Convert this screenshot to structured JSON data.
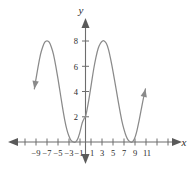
{
  "chart_data": {
    "type": "line",
    "title": "",
    "xlabel": "x",
    "ylabel": "y",
    "xlim": [
      -11.5,
      12.5
    ],
    "ylim": [
      -1.5,
      9.5
    ],
    "grid": false,
    "legend": null,
    "x_ticks": [
      -9,
      -7,
      -5,
      -3,
      -1,
      1,
      3,
      5,
      7,
      9,
      11
    ],
    "x_tick_labels": [
      "−9",
      "−7",
      "−5",
      "−3",
      "−1",
      "1",
      "3",
      "5",
      "7",
      "9",
      "11"
    ],
    "x_minor_ticks": [
      -10,
      -8,
      -6,
      -4,
      -2,
      0,
      2,
      4,
      6,
      8,
      10,
      12
    ],
    "y_ticks": [
      2,
      4,
      6,
      8
    ],
    "y_tick_labels": [
      "2",
      "4",
      "6",
      "8"
    ],
    "annotations": [
      "left end of curve carries a downward-left arrowhead near (-9.2, 4)",
      "right end of curve carries an upward-right arrowhead near (11, 4)",
      "x-axis carries arrowheads at both ends",
      "y-axis carries arrowheads at both ends"
    ],
    "features": {
      "y_intercept": 2,
      "maxima": [
        {
          "x": -7,
          "y": 8
        },
        {
          "x": 3.4,
          "y": 8
        }
      ],
      "minima_touching_axis": [
        {
          "x": -1.8,
          "y": 0
        },
        {
          "x": 8.5,
          "y": 0
        }
      ],
      "period_estimate": 10.4
    },
    "series": [
      {
        "name": "curve",
        "x": [
          -9.3,
          -9.0,
          -8.6,
          -8.2,
          -7.8,
          -7.4,
          -7.0,
          -6.6,
          -6.2,
          -5.8,
          -5.4,
          -5.0,
          -4.6,
          -4.2,
          -3.8,
          -3.4,
          -3.0,
          -2.6,
          -2.2,
          -1.8,
          -1.4,
          -1.0,
          -0.6,
          -0.2,
          0.0,
          0.3,
          0.7,
          1.1,
          1.5,
          1.9,
          2.3,
          2.7,
          3.1,
          3.4,
          3.8,
          4.2,
          4.6,
          5.0,
          5.4,
          5.8,
          6.2,
          6.6,
          7.0,
          7.4,
          7.8,
          8.2,
          8.5,
          8.9,
          9.3,
          9.7,
          10.1,
          10.5,
          10.9
        ],
        "y": [
          4.2,
          5.0,
          6.0,
          6.9,
          7.5,
          7.9,
          8.0,
          7.9,
          7.5,
          6.9,
          6.0,
          5.0,
          3.9,
          2.8,
          1.8,
          1.0,
          0.45,
          0.1,
          0.0,
          0.0,
          0.25,
          0.8,
          1.5,
          1.9,
          2.0,
          2.6,
          3.6,
          4.7,
          5.8,
          6.7,
          7.4,
          7.8,
          8.0,
          8.0,
          7.8,
          7.3,
          6.5,
          5.6,
          4.6,
          3.6,
          2.6,
          1.7,
          1.0,
          0.45,
          0.12,
          0.0,
          0.0,
          0.25,
          0.8,
          1.6,
          2.5,
          3.4,
          4.2
        ]
      }
    ]
  },
  "axes": {
    "x_axis_name": "x",
    "y_axis_name": "y"
  }
}
